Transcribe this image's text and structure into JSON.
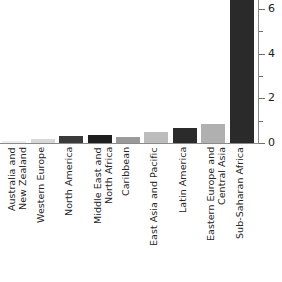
{
  "chart_data": {
    "type": "bar",
    "title": "",
    "xlabel": "",
    "ylabel": "",
    "ylim": [
      0,
      6.4
    ],
    "grid": false,
    "legend": null,
    "y_ticks_major": [
      0,
      2,
      4,
      6
    ],
    "y_ticks_minor": [
      1,
      3,
      5
    ],
    "y_tick_labels": [
      "0",
      "2",
      "4",
      "6"
    ],
    "categories": [
      "Australia and\nNew Zealand",
      "Western Europe",
      "North America",
      "Middle East and\nNorth Africa",
      "Caribbean",
      "East Asia and Pacific",
      "Latin America",
      "Eastern Europe and\nCentral Asia",
      "Sub-Saharan Africa"
    ],
    "values": [
      0.1,
      0.2,
      0.3,
      0.35,
      0.25,
      0.5,
      0.65,
      0.85,
      6.4
    ],
    "bar_colors": [
      "#ededed",
      "#d8d8d8",
      "#3a3a3a",
      "#1e1e1e",
      "#9a9a9a",
      "#bcbcbc",
      "#2b2b2b",
      "#b0b0b0",
      "#2a2a2a"
    ]
  },
  "axis": {
    "axis_color": "#8a8a8a",
    "tick_color": "#6e6e6e",
    "label_color": "#1b1b1b"
  }
}
